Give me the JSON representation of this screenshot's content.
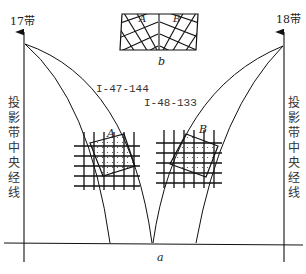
{
  "figure": {
    "type": "map-projection-zone-diagram",
    "left_zone": {
      "label": "17带",
      "meridian_label": "投影带中央经线"
    },
    "right_zone": {
      "label": "18带",
      "meridian_label": "投影带中央经线"
    },
    "sheets": [
      {
        "id": "I-47-144",
        "label": "I-47-144",
        "patch_label": "A"
      },
      {
        "id": "I-48-133",
        "label": "I-48-133",
        "patch_label": "B"
      }
    ],
    "subfigures": {
      "main": "a",
      "inset": "b"
    },
    "inset": {
      "patch_labels": [
        "A",
        "B"
      ]
    },
    "colors": {
      "line": "#111111",
      "text": "#222222",
      "background": "#ffffff"
    }
  }
}
